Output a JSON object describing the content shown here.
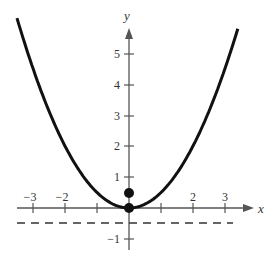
{
  "chart_data": {
    "type": "line",
    "title": "",
    "xlabel": "x",
    "ylabel": "y",
    "xlim": [
      -3.5,
      3.7
    ],
    "ylim": [
      -1.5,
      6
    ],
    "x_ticks": [
      -3,
      -2,
      -1,
      1,
      2,
      3
    ],
    "x_tick_labels": [
      "−3",
      "−2",
      "",
      "2",
      "3"
    ],
    "x_tick_label_values": [
      -3,
      -2,
      2,
      3
    ],
    "y_ticks": [
      -1,
      1,
      2,
      3,
      4,
      5
    ],
    "y_tick_labels": [
      "−1",
      "1",
      "2",
      "3",
      "4",
      "5"
    ],
    "series": [
      {
        "name": "parabola",
        "equation": "y = x^2 / 2",
        "style": "solid",
        "x": [
          -3.5,
          -3,
          -2,
          -1,
          0,
          1,
          2,
          3,
          3.4
        ],
        "values": [
          6.125,
          4.5,
          2,
          0.5,
          0,
          0.5,
          2,
          4.5,
          5.78
        ]
      },
      {
        "name": "directrix",
        "equation": "y = -0.5",
        "style": "dashed",
        "x": [
          -3.5,
          3.3
        ],
        "values": [
          -0.5,
          -0.5
        ]
      }
    ],
    "points": [
      {
        "name": "vertex",
        "x": 0,
        "y": 0
      },
      {
        "name": "focus",
        "x": 0,
        "y": 0.5
      }
    ],
    "grid": false,
    "legend": null
  },
  "labels": {
    "x_axis": "x",
    "y_axis": "y",
    "xt_m3": "−3",
    "xt_m2": "−2",
    "xt_2": "2",
    "xt_3": "3",
    "yt_m1": "−1",
    "yt_1": "1",
    "yt_2": "2",
    "yt_3": "3",
    "yt_4": "4",
    "yt_5": "5"
  }
}
